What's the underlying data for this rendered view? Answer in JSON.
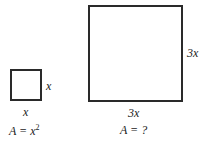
{
  "small_square": {
    "side_right_label": "x",
    "side_bottom_label": "x",
    "area_prefix": "A = ",
    "area_base": "x",
    "area_exponent": "2"
  },
  "large_square": {
    "side_right_label": "3x",
    "side_bottom_label": "3x",
    "area_label": "A = ?"
  }
}
